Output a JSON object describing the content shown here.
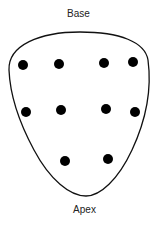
{
  "labels": {
    "top": "Base",
    "bottom": "Apex"
  },
  "dot_color": "#000000",
  "outline_color": "#111111",
  "dots": [
    {
      "row": 1,
      "col": 1
    },
    {
      "row": 1,
      "col": 2
    },
    {
      "row": 1,
      "col": 3
    },
    {
      "row": 1,
      "col": 4
    },
    {
      "row": 2,
      "col": 1
    },
    {
      "row": 2,
      "col": 2
    },
    {
      "row": 2,
      "col": 3
    },
    {
      "row": 2,
      "col": 4
    },
    {
      "row": 3,
      "col": 2
    },
    {
      "row": 3,
      "col": 3
    }
  ]
}
